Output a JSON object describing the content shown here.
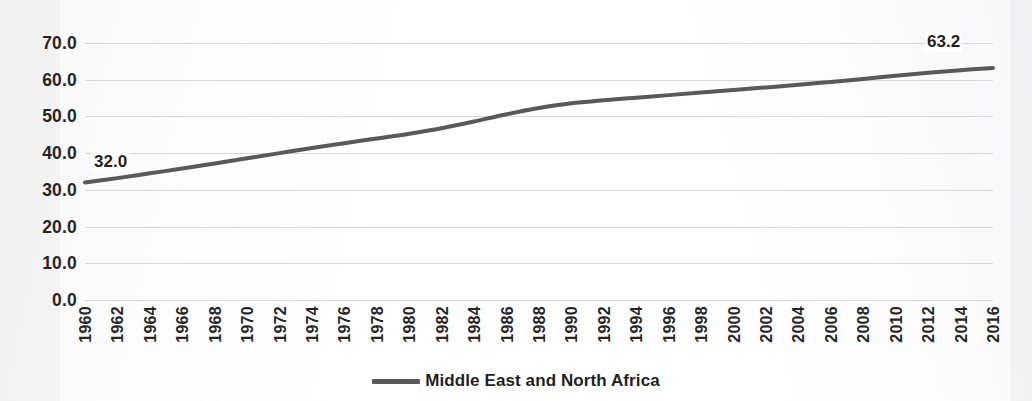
{
  "chart_data": {
    "type": "line",
    "title": "",
    "subtitle": "",
    "xlabel": "",
    "ylabel": "",
    "grid": true,
    "legend_position": "bottom-center",
    "xlim": [
      1960,
      2016
    ],
    "ylim": [
      0.0,
      70.0
    ],
    "y_ticks": [
      "0.0",
      "10.0",
      "20.0",
      "30.0",
      "40.0",
      "50.0",
      "60.0",
      "70.0"
    ],
    "y_tick_values": [
      0,
      10,
      20,
      30,
      40,
      50,
      60,
      70
    ],
    "x_ticks": [
      "1960",
      "1962",
      "1964",
      "1966",
      "1968",
      "1970",
      "1972",
      "1974",
      "1976",
      "1978",
      "1980",
      "1982",
      "1984",
      "1986",
      "1988",
      "1990",
      "1992",
      "1994",
      "1996",
      "1998",
      "2000",
      "2002",
      "2004",
      "2006",
      "2008",
      "2010",
      "2012",
      "2014",
      "2016"
    ],
    "x_tick_values": [
      1960,
      1962,
      1964,
      1966,
      1968,
      1970,
      1972,
      1974,
      1976,
      1978,
      1980,
      1982,
      1984,
      1986,
      1988,
      1990,
      1992,
      1994,
      1996,
      1998,
      2000,
      2002,
      2004,
      2006,
      2008,
      2010,
      2012,
      2014,
      2016
    ],
    "series": [
      {
        "name": "Middle East and North Africa",
        "color": "#595959",
        "line_width": 4,
        "x": [
          1960,
          1962,
          1964,
          1966,
          1968,
          1970,
          1972,
          1974,
          1976,
          1978,
          1980,
          1982,
          1984,
          1986,
          1988,
          1990,
          1992,
          1994,
          1996,
          1998,
          2000,
          2002,
          2004,
          2006,
          2008,
          2010,
          2012,
          2014,
          2016
        ],
        "values": [
          32.0,
          33.2,
          34.5,
          35.8,
          37.2,
          38.6,
          40.0,
          41.4,
          42.7,
          44.0,
          45.3,
          46.8,
          48.6,
          50.6,
          52.3,
          53.6,
          54.4,
          55.1,
          55.8,
          56.5,
          57.2,
          57.9,
          58.6,
          59.4,
          60.2,
          61.1,
          61.9,
          62.6,
          63.2
        ]
      }
    ],
    "data_labels": [
      {
        "point": "first",
        "value": "32.0"
      },
      {
        "point": "last",
        "value": "63.2"
      }
    ]
  },
  "legend": {
    "entries": [
      {
        "label": "Middle East and North Africa",
        "color": "#595959"
      }
    ]
  }
}
